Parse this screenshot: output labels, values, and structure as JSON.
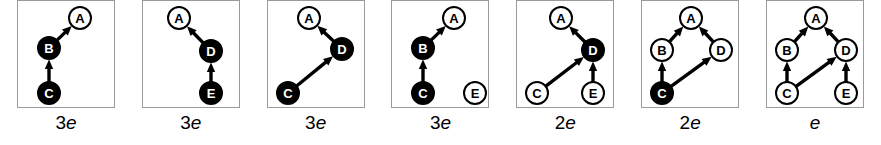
{
  "figure": {
    "type": "graph-sequence",
    "node_radius": 11,
    "box_width": 98,
    "box_height": 108,
    "colors": {
      "filled_node_fill": "#000000",
      "filled_node_label": "#ffffff",
      "open_node_fill": "#ffffff",
      "open_node_label": "#000000",
      "node_stroke": "#000000",
      "edge": "#000000",
      "box_border": "#9a9a9a",
      "background": "#ffffff"
    },
    "panels": [
      {
        "id": "panel-1",
        "caption_number": "3",
        "caption_symbol": "e",
        "nodes": [
          {
            "id": "A",
            "label": "A",
            "x": 62,
            "y": 17,
            "filled": false
          },
          {
            "id": "B",
            "label": "B",
            "x": 31,
            "y": 47,
            "filled": true
          },
          {
            "id": "C",
            "label": "C",
            "x": 31,
            "y": 92,
            "filled": true
          }
        ],
        "edges": [
          {
            "from": "B",
            "to": "A"
          },
          {
            "from": "C",
            "to": "B"
          }
        ]
      },
      {
        "id": "panel-2",
        "caption_number": "3",
        "caption_symbol": "e",
        "nodes": [
          {
            "id": "A",
            "label": "A",
            "x": 36,
            "y": 17,
            "filled": false
          },
          {
            "id": "D",
            "label": "D",
            "x": 68,
            "y": 50,
            "filled": true
          },
          {
            "id": "E",
            "label": "E",
            "x": 68,
            "y": 92,
            "filled": true
          }
        ],
        "edges": [
          {
            "from": "D",
            "to": "A"
          },
          {
            "from": "E",
            "to": "D"
          }
        ]
      },
      {
        "id": "panel-3",
        "caption_number": "3",
        "caption_symbol": "e",
        "nodes": [
          {
            "id": "A",
            "label": "A",
            "x": 41,
            "y": 17,
            "filled": false
          },
          {
            "id": "D",
            "label": "D",
            "x": 74,
            "y": 48,
            "filled": true
          },
          {
            "id": "C",
            "label": "C",
            "x": 20,
            "y": 92,
            "filled": true
          }
        ],
        "edges": [
          {
            "from": "D",
            "to": "A"
          },
          {
            "from": "C",
            "to": "D"
          }
        ]
      },
      {
        "id": "panel-4",
        "caption_number": "3",
        "caption_symbol": "e",
        "nodes": [
          {
            "id": "A",
            "label": "A",
            "x": 62,
            "y": 17,
            "filled": false
          },
          {
            "id": "B",
            "label": "B",
            "x": 31,
            "y": 47,
            "filled": true
          },
          {
            "id": "C",
            "label": "C",
            "x": 31,
            "y": 92,
            "filled": true
          },
          {
            "id": "E",
            "label": "E",
            "x": 83,
            "y": 92,
            "filled": false
          }
        ],
        "edges": [
          {
            "from": "B",
            "to": "A"
          },
          {
            "from": "C",
            "to": "B"
          }
        ]
      },
      {
        "id": "panel-5",
        "caption_number": "2",
        "caption_symbol": "e",
        "nodes": [
          {
            "id": "A",
            "label": "A",
            "x": 44,
            "y": 17,
            "filled": false
          },
          {
            "id": "D",
            "label": "D",
            "x": 76,
            "y": 49,
            "filled": true
          },
          {
            "id": "C",
            "label": "C",
            "x": 20,
            "y": 92,
            "filled": false
          },
          {
            "id": "E",
            "label": "E",
            "x": 76,
            "y": 92,
            "filled": false
          }
        ],
        "edges": [
          {
            "from": "D",
            "to": "A"
          },
          {
            "from": "C",
            "to": "D"
          },
          {
            "from": "E",
            "to": "D"
          }
        ]
      },
      {
        "id": "panel-6",
        "caption_number": "2",
        "caption_symbol": "e",
        "nodes": [
          {
            "id": "A",
            "label": "A",
            "x": 49,
            "y": 17,
            "filled": false
          },
          {
            "id": "B",
            "label": "B",
            "x": 20,
            "y": 49,
            "filled": false
          },
          {
            "id": "D",
            "label": "D",
            "x": 79,
            "y": 49,
            "filled": false
          },
          {
            "id": "C",
            "label": "C",
            "x": 20,
            "y": 92,
            "filled": true
          }
        ],
        "edges": [
          {
            "from": "B",
            "to": "A"
          },
          {
            "from": "D",
            "to": "A"
          },
          {
            "from": "C",
            "to": "B"
          },
          {
            "from": "C",
            "to": "D"
          }
        ]
      },
      {
        "id": "panel-7",
        "caption_number": "",
        "caption_symbol": "e",
        "nodes": [
          {
            "id": "A",
            "label": "A",
            "x": 49,
            "y": 17,
            "filled": false
          },
          {
            "id": "B",
            "label": "B",
            "x": 20,
            "y": 49,
            "filled": false
          },
          {
            "id": "D",
            "label": "D",
            "x": 79,
            "y": 49,
            "filled": false
          },
          {
            "id": "C",
            "label": "C",
            "x": 20,
            "y": 92,
            "filled": false
          },
          {
            "id": "E",
            "label": "E",
            "x": 79,
            "y": 92,
            "filled": false
          }
        ],
        "edges": [
          {
            "from": "B",
            "to": "A"
          },
          {
            "from": "D",
            "to": "A"
          },
          {
            "from": "C",
            "to": "B"
          },
          {
            "from": "C",
            "to": "D"
          },
          {
            "from": "E",
            "to": "D"
          }
        ]
      }
    ]
  }
}
